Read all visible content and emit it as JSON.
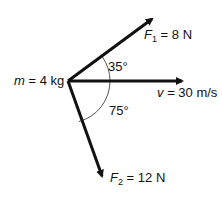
{
  "diagram": {
    "type": "free-body force diagram",
    "mass": {
      "symbol": "m",
      "eq": "=",
      "value": "4 kg"
    },
    "forces": [
      {
        "symbol": "F",
        "subscript": "1",
        "eq": "=",
        "value": "8 N",
        "angle_label": "35°"
      },
      {
        "symbol": "F",
        "subscript": "2",
        "eq": "=",
        "value": "12 N",
        "angle_label": "75°"
      }
    ],
    "velocity": {
      "symbol": "v",
      "eq": "=",
      "value": "30 m/s"
    },
    "colors": {
      "stroke": "#111111",
      "arc": "#555555",
      "background": "#ffffff"
    }
  }
}
